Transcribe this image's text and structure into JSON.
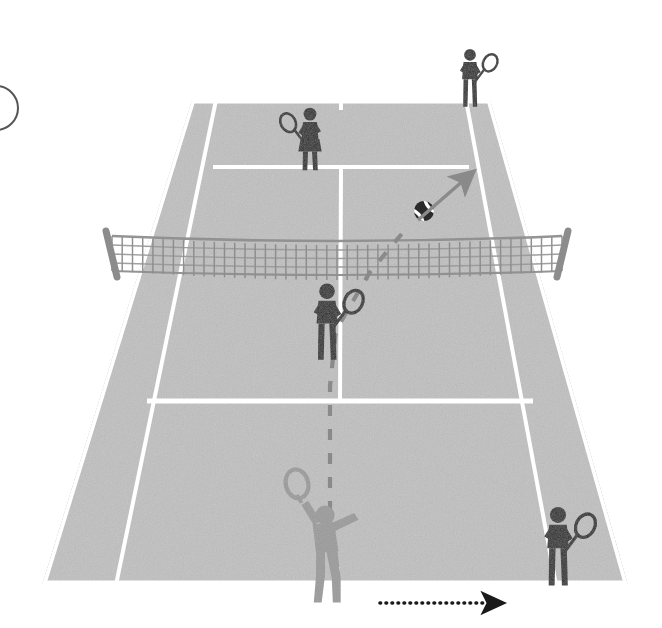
{
  "figure": {
    "type": "tennis-court-perspective-diagram",
    "title": "",
    "caption": "",
    "panel_label": "",
    "background_color": "#ffffff"
  },
  "colors": {
    "court_surface": "#c0c0c0",
    "court_surface_dark": "#b6b6b6",
    "court_line": "#ffffff",
    "player_dark": "#2b2b2b",
    "player_light": "#9a9a9a",
    "net_mesh": "#8c8c8c",
    "net_post": "#8c8c8c",
    "net_tape": "#e8e8e8",
    "ball_body": "#2b2b2b",
    "ball_seam": "#ffffff",
    "trajectory_dashed": "#8a8a8a",
    "arrow_ball": "#8a8a8a",
    "arrow_movement": "#1a1a1a",
    "panel_arc": "#555555"
  },
  "court": {
    "name": "tennis-court",
    "perspective": "viewed-from-behind-near-baseline",
    "outline_points": "192,100 490,100 628,585 42,585",
    "singles_left_top_x": 215,
    "singles_right_top_x": 467,
    "singles_left_bottom_x": 95,
    "singles_right_bottom_x": 575,
    "baseline_far_y": 100,
    "baseline_near_y": 585,
    "net_y": 252,
    "service_line_far_y": 167,
    "service_line_near_y": 403,
    "lines": [
      {
        "name": "far-baseline",
        "label": "Baseline (far)"
      },
      {
        "name": "near-baseline",
        "label": "Baseline (near)"
      },
      {
        "name": "left-doubles-sideline",
        "label": "Doubles sideline (left)"
      },
      {
        "name": "right-doubles-sideline",
        "label": "Doubles sideline (right)"
      },
      {
        "name": "left-singles-sideline",
        "label": "Singles sideline (left)"
      },
      {
        "name": "right-singles-sideline",
        "label": "Singles sideline (right)"
      },
      {
        "name": "far-service-line",
        "label": "Service line (far)"
      },
      {
        "name": "near-service-line",
        "label": "Service line (near)"
      },
      {
        "name": "center-service-line",
        "label": "Center service line"
      },
      {
        "name": "center-mark-near",
        "label": "Center mark (near)"
      },
      {
        "name": "center-mark-far",
        "label": "Center mark (far)"
      }
    ]
  },
  "net": {
    "name": "tennis-net",
    "left_post_x": 108,
    "right_post_x": 566,
    "top_y": 232,
    "bottom_y": 270,
    "mesh_columns": 44,
    "mesh_rows": 4
  },
  "players": [
    {
      "id": "player-far-right-receiver",
      "label": "Far court right player",
      "team": "receiving",
      "shade": "dark",
      "x": 470,
      "y": 88,
      "scale": 0.72,
      "pose": "standing-racket-right",
      "racket_side": "right"
    },
    {
      "id": "player-far-left-net",
      "label": "Far court left player at net",
      "team": "receiving",
      "shade": "dark",
      "x": 310,
      "y": 150,
      "scale": 0.78,
      "pose": "standing-racket-left-skirt",
      "racket_side": "left"
    },
    {
      "id": "player-near-net",
      "label": "Near court net player",
      "team": "serving",
      "shade": "dark",
      "x": 327,
      "y": 335,
      "scale": 0.95,
      "pose": "standing-racket-right",
      "racket_side": "right"
    },
    {
      "id": "player-server",
      "label": "Server",
      "team": "serving",
      "shade": "light",
      "x": 325,
      "y": 560,
      "scale": 1.12,
      "pose": "serving-overhead",
      "racket_side": "left"
    },
    {
      "id": "player-near-right",
      "label": "Near court right player",
      "team": "receiving",
      "shade": "dark",
      "x": 558,
      "y": 560,
      "scale": 0.98,
      "pose": "standing-racket-right",
      "racket_side": "right"
    }
  ],
  "ball": {
    "name": "tennis-ball",
    "x": 424,
    "y": 211,
    "radius": 10,
    "rotation_deg": -40
  },
  "arrows": [
    {
      "id": "ball-direction-arrow",
      "label": "Ball direction",
      "style": "solid",
      "color": "#8a8a8a",
      "from_x": 418,
      "from_y": 220,
      "to_x": 464,
      "to_y": 180
    },
    {
      "id": "player-movement-arrow",
      "label": "Player movement",
      "style": "dotted",
      "color": "#1a1a1a",
      "from_x": 380,
      "from_y": 603,
      "to_x": 484,
      "to_y": 603
    }
  ],
  "trajectory": {
    "id": "serve-trajectory",
    "label": "Serve trajectory",
    "style": "dashed",
    "color": "#8a8a8a",
    "dash": "11 13",
    "path": "M 330,536 L 330,386 L 336,330 L 370,272 L 410,224"
  },
  "panel_marker": {
    "name": "panel-arc",
    "visible": true,
    "cx": -4,
    "cy": 108,
    "r": 22
  }
}
